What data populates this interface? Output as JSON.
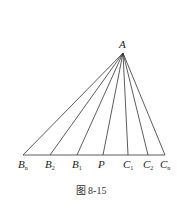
{
  "figure": {
    "caption": "图 8-15",
    "apex": {
      "label": "A",
      "x": 123,
      "y": 53
    },
    "baseline_y": 155,
    "points": [
      {
        "id": "Bn",
        "base": "B",
        "sub": "n",
        "x": 23
      },
      {
        "id": "B2",
        "base": "B",
        "sub": "2",
        "x": 50
      },
      {
        "id": "B1",
        "base": "B",
        "sub": "1",
        "x": 77
      },
      {
        "id": "P",
        "base": "P",
        "sub": "",
        "x": 103
      },
      {
        "id": "C1",
        "base": "C",
        "sub": "1",
        "x": 128
      },
      {
        "id": "C2",
        "base": "C",
        "sub": "2",
        "x": 148
      },
      {
        "id": "Cn",
        "base": "C",
        "sub": "n",
        "x": 165
      }
    ],
    "stroke_color": "#333333"
  }
}
